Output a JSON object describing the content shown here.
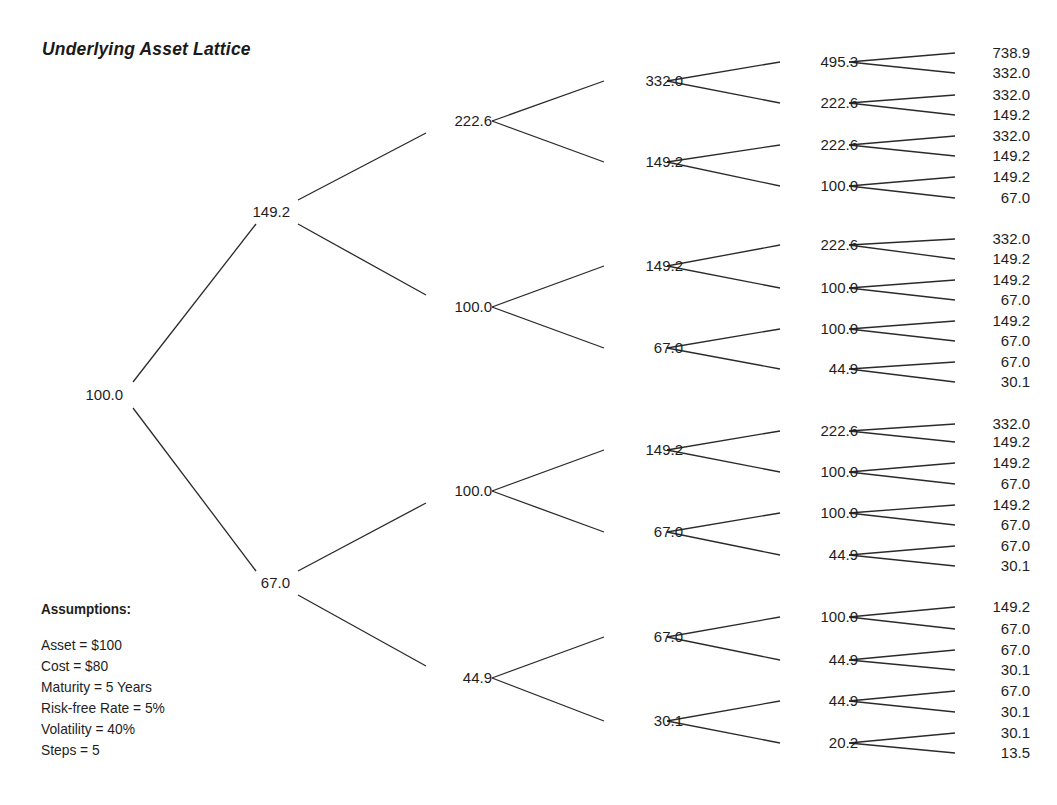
{
  "title": "Underlying Asset Lattice",
  "assumptions": {
    "heading": "Assumptions:",
    "lines": [
      "Asset = $100",
      "Cost = $80",
      "Maturity = 5 Years",
      "Risk-free Rate = 5%",
      "Volatility = 40%",
      "Steps = 5"
    ]
  },
  "lattice": {
    "levels": [
      [
        "100.0"
      ],
      [
        "149.2",
        "67.0"
      ],
      [
        "222.6",
        "100.0",
        "100.0",
        "44.9"
      ],
      [
        "332.0",
        "149.2",
        "149.2",
        "67.0",
        "149.2",
        "67.0",
        "67.0",
        "30.1"
      ],
      [
        "495.3",
        "222.6",
        "222.6",
        "100.0",
        "222.6",
        "100.0",
        "100.0",
        "44.9",
        "222.6",
        "100.0",
        "100.0",
        "44.9",
        "100.0",
        "44.9",
        "44.9",
        "20.2"
      ],
      [
        "738.9",
        "332.0",
        "332.0",
        "149.2",
        "332.0",
        "149.2",
        "149.2",
        "67.0",
        "332.0",
        "149.2",
        "149.2",
        "67.0",
        "149.2",
        "67.0",
        "67.0",
        "30.1",
        "332.0",
        "149.2",
        "149.2",
        "67.0",
        "149.2",
        "67.0",
        "67.0",
        "30.1",
        "149.2",
        "67.0",
        "67.0",
        "30.1",
        "67.0",
        "30.1",
        "30.1",
        "13.5"
      ]
    ]
  },
  "chart_data": {
    "type": "binomial_tree",
    "title": "Underlying Asset Lattice",
    "steps": 5,
    "root": 100.0,
    "nodes_by_step": [
      [
        100.0
      ],
      [
        149.2,
        67.0
      ],
      [
        222.6,
        100.0,
        100.0,
        44.9
      ],
      [
        332.0,
        149.2,
        149.2,
        67.0,
        149.2,
        67.0,
        67.0,
        30.1
      ],
      [
        495.3,
        222.6,
        222.6,
        100.0,
        222.6,
        100.0,
        100.0,
        44.9,
        222.6,
        100.0,
        100.0,
        44.9,
        100.0,
        44.9,
        44.9,
        20.2
      ],
      [
        738.9,
        332.0,
        332.0,
        149.2,
        332.0,
        149.2,
        149.2,
        67.0,
        332.0,
        149.2,
        149.2,
        67.0,
        149.2,
        67.0,
        67.0,
        30.1,
        332.0,
        149.2,
        149.2,
        67.0,
        149.2,
        67.0,
        67.0,
        30.1,
        149.2,
        67.0,
        67.0,
        30.1,
        67.0,
        30.1,
        30.1,
        13.5
      ]
    ],
    "annotations": [
      "Assumptions:",
      "Asset = $100",
      "Cost = $80",
      "Maturity = 5 Years",
      "Risk-free Rate = 5%",
      "Volatility = 40%",
      "Steps = 5"
    ]
  }
}
